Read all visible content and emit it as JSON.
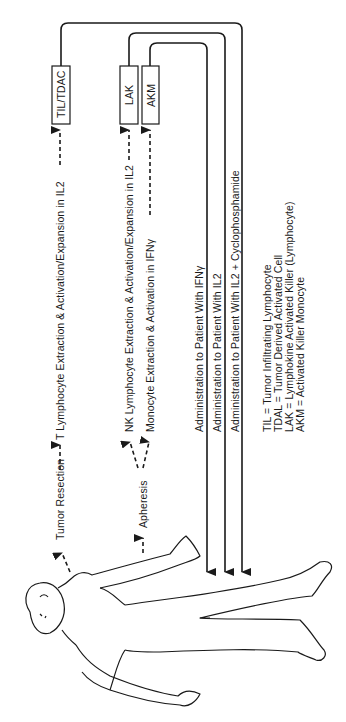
{
  "boxes": {
    "til_tdac": "TIL/TDAC",
    "lak": "LAK",
    "akm": "AKM"
  },
  "processes": {
    "tumor_resection": "Tumor Resection",
    "t_lymphocyte": "T Lymphocyte Extraction & Activation/Expansion in IL2",
    "apheresis": "Apheresis",
    "nk_lymphocyte": "NK Lymphocyte Extraction & Activation/Expansion in IL2",
    "monocyte": "Monocyte Extraction & Activation in IFNγ"
  },
  "administration": {
    "ifn": "Administration to Patient With IFNγ",
    "il2": "Administration to Patient With IL2",
    "il2_cyclo": "Administration to Patient With IL2 + Cyclophosphamide"
  },
  "legend": [
    "TIL = Tumor Infiltrating Lymphocyte",
    "TDAL = Tumor Derived Activated Cell",
    "LAK = Lymphokine Activated Killer (Lymphocyte)",
    "AKM = Activated Killer Monocyte"
  ],
  "colors": {
    "line": "#1a1a1a",
    "background": "#ffffff"
  }
}
